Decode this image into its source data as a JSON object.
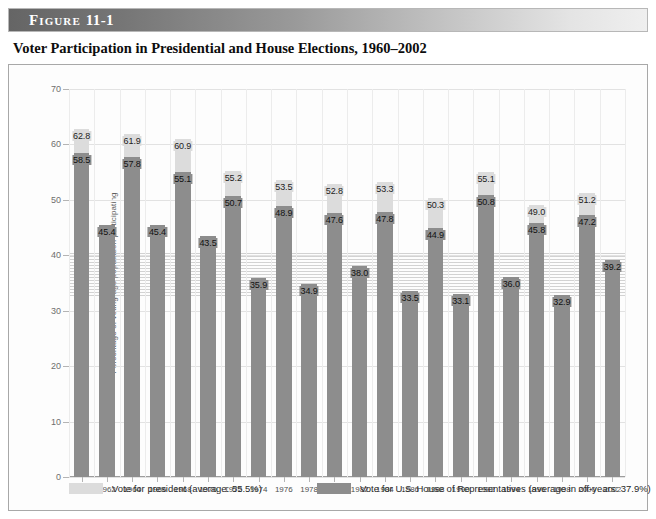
{
  "figure": {
    "label": "Figure",
    "number": "11-1",
    "title": "Voter Participation in Presidential and House Elections, 1960–2002"
  },
  "chart_data": {
    "type": "bar",
    "title": "Voter Participation in Presidential and House Elections, 1960–2002",
    "xlabel": "",
    "ylabel": "Percentage of voting-age population participating",
    "ylim": [
      0,
      70
    ],
    "yticks": [
      0,
      10,
      20,
      30,
      40,
      50,
      60,
      70
    ],
    "grid": true,
    "legend_position": "bottom",
    "categories": [
      "1960",
      "1962",
      "1964",
      "1966",
      "1968",
      "1970",
      "1972",
      "1974",
      "1976",
      "1978",
      "1980",
      "1982",
      "1984",
      "1986",
      "1988",
      "1990",
      "1992",
      "1994",
      "1996",
      "1998",
      "2000",
      "2002"
    ],
    "series": [
      {
        "name": "Vote for president (average: 55.5%)",
        "color": "#dcdcdc",
        "values": [
          62.8,
          null,
          61.9,
          null,
          60.9,
          null,
          55.2,
          null,
          53.5,
          null,
          52.8,
          null,
          53.3,
          null,
          50.3,
          null,
          55.1,
          null,
          49.0,
          null,
          51.2,
          null
        ]
      },
      {
        "name": "Vote for U.S. House of Representatives (average in off-years: 37.9%)",
        "color": "#8d8d8d",
        "values": [
          58.5,
          45.4,
          57.8,
          45.4,
          55.1,
          43.5,
          50.7,
          35.9,
          48.9,
          34.9,
          47.6,
          38.0,
          47.8,
          33.5,
          44.9,
          33.1,
          50.8,
          36.0,
          45.8,
          32.9,
          47.2,
          39.2
        ]
      }
    ],
    "presidential_average": 55.5,
    "offyear_house_average": 37.9
  },
  "legend": {
    "president": {
      "label": "Vote for president (average: 55.5%)",
      "color": "#dcdcdc"
    },
    "house": {
      "label": "Vote for U.S. House of Representatives (average in off-years: 37.9%)",
      "color": "#8d8d8d"
    }
  }
}
